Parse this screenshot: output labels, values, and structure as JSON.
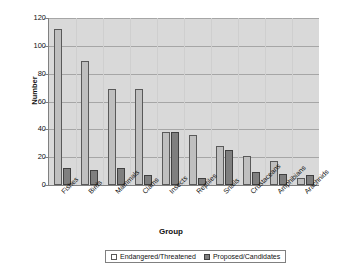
{
  "chart_data": {
    "type": "bar",
    "title": "",
    "xlabel": "Group",
    "ylabel": "Number",
    "ylim": [
      0,
      120
    ],
    "ytick_step": 20,
    "yticks": [
      0,
      20,
      40,
      60,
      80,
      100,
      120
    ],
    "grid": true,
    "legend_position": "bottom",
    "categories": [
      "Fishes",
      "Birds",
      "Mammals",
      "Clams",
      "Insects",
      "Reptiles",
      "Snails",
      "Crustaceans",
      "Amphibians",
      "Arachnids"
    ],
    "series": [
      {
        "name": "Endangered/Threatened",
        "color": "#bfbfbf",
        "values": [
          112,
          89,
          69,
          69,
          38,
          36,
          28,
          21,
          17,
          5
        ]
      },
      {
        "name": "Proposed/Candidates",
        "color": "#7f7f7f",
        "values": [
          12,
          11,
          12,
          7,
          38,
          5,
          25,
          9,
          8,
          7
        ]
      }
    ]
  },
  "axes": {
    "y_title": "Number",
    "x_title": "Group"
  },
  "legend": {
    "items": [
      {
        "label": "Endangered/Threatened"
      },
      {
        "label": "Proposed/Candidates"
      }
    ]
  }
}
